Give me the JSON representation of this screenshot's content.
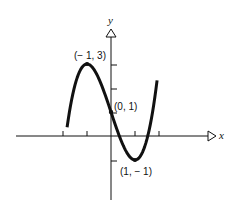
{
  "chart_data": {
    "type": "line",
    "title": "",
    "xlabel": "x",
    "ylabel": "y",
    "function": "x^3 - 3x + 1",
    "xlim": [
      -2,
      2
    ],
    "ylim": [
      -2,
      3
    ],
    "x_ticks": [
      -2,
      -1,
      1,
      2
    ],
    "y_ticks": [
      -1,
      1,
      2,
      3
    ],
    "grid": false,
    "series": [
      {
        "name": "curve",
        "x": [
          -1.83,
          -1.5,
          -1.0,
          -0.5,
          0.0,
          0.5,
          1.0,
          1.5,
          1.92
        ],
        "values": [
          -0.64,
          2.125,
          3.0,
          2.375,
          1.0,
          -0.375,
          -1.0,
          -0.125,
          2.32
        ]
      }
    ],
    "annotations": [
      {
        "label": "(−1, 3)",
        "x": -1,
        "y": 3
      },
      {
        "label": "(0, 1)",
        "x": 0,
        "y": 1
      },
      {
        "label": "(1, −1)",
        "x": 1,
        "y": -1
      }
    ]
  },
  "labels": {
    "x_axis": "x",
    "y_axis": "y",
    "max_point": "(− 1, 3)",
    "intercept_point": "(0, 1)",
    "min_point": "(1, − 1)"
  }
}
